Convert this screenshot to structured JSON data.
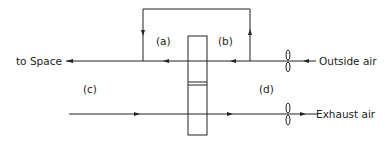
{
  "diagram": {
    "labels": {
      "to_space": "to Space",
      "outside_air": "Outside air",
      "exhaust_air": "Exhaust air",
      "a": "(a)",
      "b": "(b)",
      "c": "(c)",
      "d": "(d)"
    },
    "colors": {
      "line": "#222222",
      "background": "#ffffff"
    }
  }
}
